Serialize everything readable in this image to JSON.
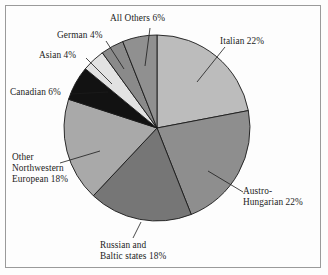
{
  "chart_data": {
    "type": "pie",
    "title": "",
    "subtitle": "",
    "xlabel": "",
    "ylabel": "",
    "legend_position": "callout-labels",
    "grid": false,
    "units": "percent",
    "total": 100,
    "start_angle_deg": 0,
    "direction": "clockwise",
    "categories": [
      "Italian",
      "Austro-Hungarian",
      "Russian and Baltic states",
      "Other Northwestern European",
      "Canadian",
      "Asian",
      "German",
      "All Others"
    ],
    "values": [
      22,
      22,
      18,
      18,
      6,
      4,
      4,
      6
    ],
    "labels": [
      "Italian 22%",
      "Austro-Hungarian 22%",
      "Russian and Baltic states 18%",
      "Other Northwestern European 18%",
      "Canadian 6%",
      "Asian 4%",
      "German 4%",
      "All Others 6%"
    ],
    "colors": [
      "#bcbcbc",
      "#8e8e8e",
      "#767676",
      "#a9a9a9",
      "#121212",
      "#e2e2e2",
      "#8a8a8a",
      "#909090"
    ],
    "slice_edge_color": "#1a1a1a"
  },
  "labels": {
    "italian": {
      "lines": [
        "Italian 22%"
      ]
    },
    "austro_hungarian": {
      "lines": [
        "Austro-",
        "Hungarian 22%"
      ]
    },
    "russian_baltic": {
      "lines": [
        "Russian and",
        "Baltic states 18%"
      ]
    },
    "other_northwestern_european": {
      "lines": [
        "Other",
        "Northwestern",
        "European 18%"
      ]
    },
    "canadian": {
      "lines": [
        "Canadian 6%"
      ]
    },
    "asian": {
      "lines": [
        "Asian 4%"
      ]
    },
    "german": {
      "lines": [
        "German 4%"
      ]
    },
    "all_others": {
      "lines": [
        "All Others 6%"
      ]
    }
  }
}
